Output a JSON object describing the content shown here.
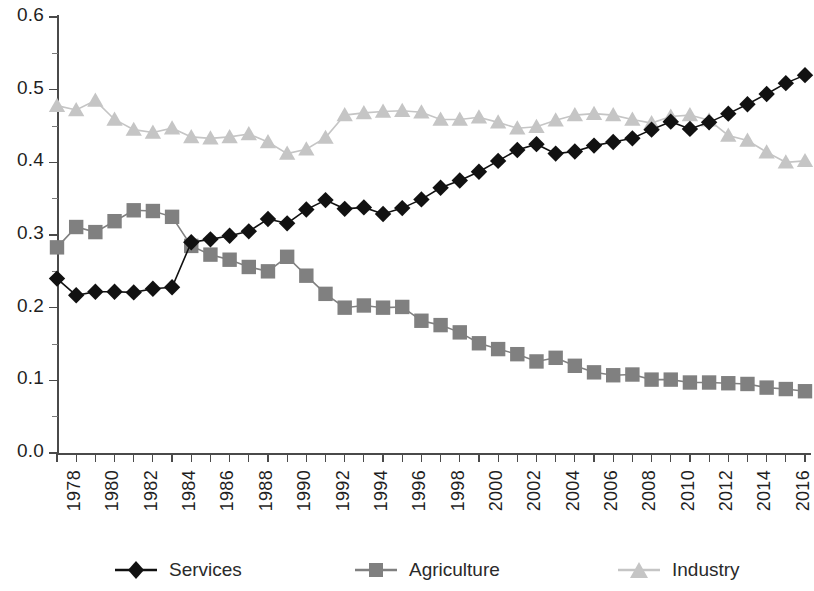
{
  "chart_data": {
    "type": "line",
    "title": "",
    "subtitle": "",
    "xlabel": "",
    "ylabel": "",
    "xlim": [
      1978,
      2017
    ],
    "ylim": [
      0.0,
      0.6
    ],
    "grid": false,
    "legend_position": "bottom",
    "y_ticks": [
      "0.0",
      "0.1",
      "0.2",
      "0.3",
      "0.4",
      "0.5",
      "0.6"
    ],
    "y_tick_values": [
      0.0,
      0.1,
      0.2,
      0.3,
      0.4,
      0.5,
      0.6
    ],
    "y_minor_ticks": [
      0.05,
      0.15,
      0.25,
      0.35,
      0.45,
      0.55
    ],
    "x_tick_labels": [
      "1978",
      "1980",
      "1982",
      "1984",
      "1986",
      "1988",
      "1990",
      "1992",
      "1994",
      "1996",
      "1998",
      "2000",
      "2002",
      "2004",
      "2006",
      "2008",
      "2010",
      "2012",
      "2014",
      "2016"
    ],
    "x": [
      1978,
      1979,
      1980,
      1981,
      1982,
      1983,
      1984,
      1985,
      1986,
      1987,
      1988,
      1989,
      1990,
      1991,
      1992,
      1993,
      1994,
      1995,
      1996,
      1997,
      1998,
      1999,
      2000,
      2001,
      2002,
      2003,
      2004,
      2005,
      2006,
      2007,
      2008,
      2009,
      2010,
      2011,
      2012,
      2013,
      2014,
      2015,
      2016,
      2017
    ],
    "series": [
      {
        "name": "Services",
        "color": "#111111",
        "marker": "diamond",
        "values": [
          0.24,
          0.217,
          0.222,
          0.222,
          0.221,
          0.226,
          0.228,
          0.29,
          0.294,
          0.299,
          0.305,
          0.322,
          0.316,
          0.335,
          0.348,
          0.336,
          0.338,
          0.329,
          0.337,
          0.349,
          0.365,
          0.375,
          0.387,
          0.402,
          0.417,
          0.425,
          0.412,
          0.415,
          0.423,
          0.428,
          0.433,
          0.445,
          0.456,
          0.446,
          0.455,
          0.467,
          0.48,
          0.494,
          0.509,
          0.52
        ]
      },
      {
        "name": "Agriculture",
        "color": "#808080",
        "marker": "square",
        "values": [
          0.283,
          0.311,
          0.304,
          0.319,
          0.334,
          0.333,
          0.325,
          0.285,
          0.273,
          0.266,
          0.256,
          0.25,
          0.27,
          0.244,
          0.219,
          0.2,
          0.203,
          0.2,
          0.201,
          0.182,
          0.176,
          0.166,
          0.151,
          0.143,
          0.136,
          0.126,
          0.131,
          0.12,
          0.111,
          0.107,
          0.108,
          0.101,
          0.101,
          0.097,
          0.097,
          0.096,
          0.095,
          0.09,
          0.088,
          0.085
        ]
      },
      {
        "name": "Industry",
        "color": "#c5c5c5",
        "marker": "triangle",
        "values": [
          0.478,
          0.472,
          0.485,
          0.459,
          0.445,
          0.441,
          0.447,
          0.435,
          0.433,
          0.435,
          0.439,
          0.428,
          0.412,
          0.418,
          0.434,
          0.465,
          0.468,
          0.47,
          0.471,
          0.469,
          0.459,
          0.459,
          0.462,
          0.455,
          0.447,
          0.449,
          0.458,
          0.465,
          0.467,
          0.465,
          0.459,
          0.454,
          0.463,
          0.465,
          0.458,
          0.437,
          0.43,
          0.414,
          0.4,
          0.402
        ]
      }
    ]
  },
  "legend": {
    "items": [
      {
        "label": "Services",
        "color": "#111111",
        "marker": "diamond"
      },
      {
        "label": "Agriculture",
        "color": "#808080",
        "marker": "square"
      },
      {
        "label": "Industry",
        "color": "#c5c5c5",
        "marker": "triangle"
      }
    ]
  }
}
